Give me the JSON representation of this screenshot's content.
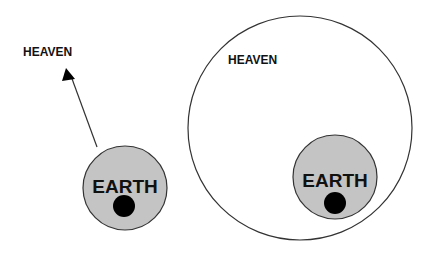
{
  "diagram": {
    "left": {
      "heaven_label": "HEAVEN",
      "earth_label": "EARTH",
      "arrow": "points from Earth up toward Heaven"
    },
    "right": {
      "heaven_label": "HEAVEN",
      "earth_label": "EARTH",
      "relation": "Earth contained within Heaven"
    },
    "colors": {
      "earth_fill": "#c4c4c4",
      "dot_fill": "#000000",
      "stroke": "#333333",
      "background": "#ffffff"
    }
  }
}
